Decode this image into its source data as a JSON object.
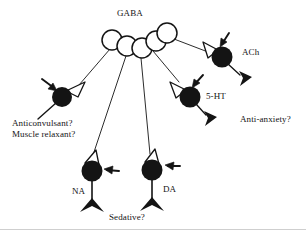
{
  "figure": {
    "background_color": "#ffffff",
    "ink_color": "#141414",
    "cell_fill": "#141414",
    "gaba_cell_fill": "#ffffff",
    "bottom_rule_color": "#cfcfcf"
  },
  "labels": {
    "gaba": "GABA",
    "ach": "ACh",
    "serotonin": "5-HT",
    "noradrenaline": "NA",
    "dopamine": "DA"
  },
  "effects": {
    "anticonvulsant": "Anticonvulsant?",
    "muscle_relaxant": "Muscle relaxant?",
    "anti_anxiety": "Anti-anxiety?",
    "sedative": "Sedative?"
  },
  "diagram_data": {
    "type": "diagram",
    "source_node": {
      "name": "GABA",
      "label": "GABA",
      "style": "chain-of-open-circles",
      "circle_count": 5,
      "fill": "#ffffff",
      "stroke": "#141414",
      "circles": [
        {
          "cx": 112,
          "cy": 40,
          "r": 10
        },
        {
          "cx": 127,
          "cy": 46,
          "r": 10
        },
        {
          "cx": 142,
          "cy": 48,
          "r": 10
        },
        {
          "cx": 156,
          "cy": 41,
          "r": 10
        },
        {
          "cx": 167,
          "cy": 33,
          "r": 10
        }
      ]
    },
    "target_nodes": [
      {
        "id": "left-cell",
        "label": "",
        "cx": 62,
        "cy": 97,
        "r": 10,
        "fill": "#141414",
        "terminal_side": "upper-right",
        "has_input_arrow": true,
        "effects": [
          "Anticonvulsant?",
          "Muscle relaxant?"
        ]
      },
      {
        "id": "ach-cell",
        "label": "ACh",
        "cx": 222,
        "cy": 57,
        "r": 10,
        "fill": "#141414",
        "terminal_side": "upper-left",
        "has_input_arrow": true,
        "effects": []
      },
      {
        "id": "5ht-cell",
        "label": "5-HT",
        "cx": 190,
        "cy": 97,
        "r": 10,
        "fill": "#141414",
        "terminal_side": "upper-left",
        "has_input_arrow": true,
        "effects": [
          "Anti-anxiety?"
        ]
      },
      {
        "id": "na-cell",
        "label": "NA",
        "cx": 92,
        "cy": 171,
        "r": 10,
        "fill": "#141414",
        "terminal_side": "top",
        "has_input_arrow": true,
        "effects": [
          "Sedative?"
        ]
      },
      {
        "id": "da-cell",
        "label": "DA",
        "cx": 152,
        "cy": 170,
        "r": 10,
        "fill": "#141414",
        "terminal_side": "top",
        "has_input_arrow": true,
        "effects": [
          "Sedative?"
        ]
      }
    ],
    "connections": [
      {
        "from": "GABA",
        "to": "left-cell"
      },
      {
        "from": "GABA",
        "to": "ach-cell"
      },
      {
        "from": "GABA",
        "to": "5ht-cell"
      },
      {
        "from": "GABA",
        "to": "na-cell"
      },
      {
        "from": "GABA",
        "to": "da-cell"
      }
    ],
    "glyph_legend": {
      "open-circle-chain": "GABA interneuron somata",
      "filled-circle": "target neuron soma",
      "open-v-terminal": "GABAergic synaptic terminal (inhibitory bouton)",
      "solid-arrow": "benzodiazepine site of action",
      "filled-triangle": "axon terminal of target neuron"
    }
  }
}
